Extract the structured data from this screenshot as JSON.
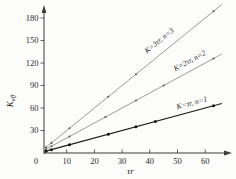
{
  "figure": {
    "background": "#fcfcfb",
    "axis_color": "#3c3c3c",
    "text_color": "#2a2a2a"
  },
  "chart_data": {
    "type": "line",
    "title": "",
    "xlabel": "τr",
    "ylabel": "K_eff",
    "ylabel_main": "K",
    "ylabel_sub": "eff",
    "origin_label": "0",
    "xlim": [
      0,
      66
    ],
    "ylim": [
      0,
      195
    ],
    "x_ticks": [
      10,
      20,
      30,
      40,
      50,
      60
    ],
    "y_ticks": [
      30,
      60,
      90,
      120,
      150,
      180
    ],
    "grid": false,
    "legend_position": "labels-on-lines",
    "series": [
      {
        "name": "K=3tr-n=3",
        "label": "K=3τr, n=3",
        "slope": 3,
        "x_start": 2.5,
        "x_end": 66,
        "marker_x": [
          2.5,
          4.5,
          11,
          25,
          35,
          63
        ],
        "line_color": "#7a7a7a",
        "marker_color": "#5f5f5f",
        "line_width": 0.75,
        "marker_radius": 1.1,
        "label_t": 46,
        "label_offset": 9
      },
      {
        "name": "K=2tr-n=2",
        "label": "K=2τr, n=2",
        "slope": 2,
        "x_start": 2.5,
        "x_end": 66,
        "marker_x": [
          2.5,
          4.5,
          11,
          24,
          35,
          45,
          63
        ],
        "line_color": "#7a7a7a",
        "marker_color": "#5f5f5f",
        "line_width": 0.75,
        "marker_radius": 1.1,
        "label_t": 56,
        "label_offset": 7
      },
      {
        "name": "K=tr-n=1",
        "label": "K=τr, n=1",
        "slope": 1,
        "x_start": 2.5,
        "x_end": 66,
        "marker_x": [
          2.5,
          4.5,
          11,
          25,
          35,
          42,
          63
        ],
        "line_color": "#1c1c1c",
        "marker_color": "#111111",
        "line_width": 1.1,
        "marker_radius": 1.5,
        "label_t": 56,
        "label_offset": 6
      }
    ]
  }
}
